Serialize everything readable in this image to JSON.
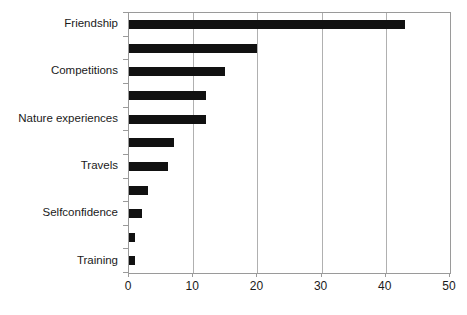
{
  "chart_data": {
    "type": "bar",
    "orientation": "horizontal",
    "title": "",
    "subtitle": "",
    "xlabel": "",
    "ylabel": "",
    "xlim": [
      0,
      50
    ],
    "xticks": [
      0,
      10,
      20,
      30,
      40,
      50
    ],
    "xtick_labels": [
      "0",
      "10",
      "20",
      "30",
      "40",
      "50"
    ],
    "grid": "vertical",
    "legend": "none",
    "bar_color": "#111111",
    "axis_color": "#9a9a9a",
    "gridline_color": "#b0b0b0",
    "categories": [
      "Friendship",
      "",
      "Competitions",
      "",
      "Nature experiences",
      "",
      "Travels",
      "",
      "Selfconfidence",
      "",
      "Training"
    ],
    "visible_category_labels": [
      "Friendship",
      "Competitions",
      "Nature experiences",
      "Travels",
      "Selfconfidence",
      "Training"
    ],
    "values": [
      43,
      20,
      15,
      12,
      12,
      7,
      6,
      3,
      2,
      1,
      1
    ]
  }
}
